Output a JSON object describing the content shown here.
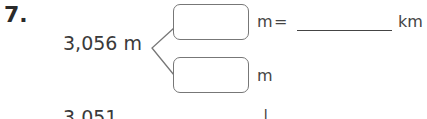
{
  "question": {
    "number": "7.",
    "value": "3,056 m",
    "top_box": {
      "value": "",
      "unit": "m",
      "equals": "=",
      "answer_blank": "",
      "answer_unit": "km"
    },
    "bottom_box": {
      "value": "",
      "unit": "m"
    },
    "next_row_partial": {
      "value": "3,051",
      "mark": "|"
    }
  },
  "colors": {
    "text": "#333333",
    "box_border": "#777777",
    "line": "#444444"
  }
}
